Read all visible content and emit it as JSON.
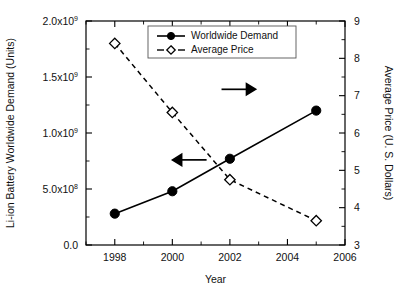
{
  "chart_data": {
    "type": "line",
    "title": "",
    "xlabel": "Year",
    "ylabel": "Li-ion Battery Worldwide Demand (Units)",
    "y2label": "Average Price (U. S. Dollars)",
    "x": [
      1998,
      2000,
      2002,
      2005
    ],
    "xlim": [
      1997,
      2006
    ],
    "xticks": [
      1998,
      2000,
      2002,
      2004,
      2006
    ],
    "xticklabels": [
      "1998",
      "2000",
      "2002",
      "2004",
      "2006"
    ],
    "xminorticks": [
      1997,
      1999,
      2001,
      2003,
      2005
    ],
    "ylim": [
      0,
      2000000000
    ],
    "yticks": [
      0,
      500000000,
      1000000000,
      1500000000,
      2000000000
    ],
    "yticklabels": [
      "0.0",
      "5.0x10",
      "1.0x10",
      "1.5x10",
      "2.0x10"
    ],
    "ytickexponents": [
      "",
      "8",
      "9",
      "9",
      "9"
    ],
    "yminorticks": [
      250000000,
      750000000,
      1250000000,
      1750000000
    ],
    "y2lim": [
      3,
      9
    ],
    "y2ticks": [
      3,
      4,
      5,
      6,
      7,
      8,
      9
    ],
    "y2ticklabels": [
      "3",
      "4",
      "5",
      "6",
      "7",
      "8",
      "9"
    ],
    "y2minorticks": [
      3.5,
      4.5,
      5.5,
      6.5,
      7.5,
      8.5
    ],
    "grid": false,
    "legend_position": "top-center",
    "series": [
      {
        "name": "Worldwide Demand",
        "axis": "left",
        "linestyle": "solid",
        "marker": "filled-circle",
        "color": "#000000",
        "values": [
          280000000,
          480000000,
          770000000,
          1200000000
        ]
      },
      {
        "name": "Average Price",
        "axis": "right",
        "linestyle": "dashed",
        "marker": "open-diamond",
        "color": "#000000",
        "values": [
          8.4,
          6.55,
          4.75,
          3.65
        ]
      }
    ],
    "annotations": [
      {
        "name": "left-axis-arrow",
        "direction": "left",
        "x": 2000.6,
        "y_frac": 0.62
      },
      {
        "name": "right-axis-arrow",
        "direction": "right",
        "x": 2002.3,
        "y_frac": 0.305
      }
    ]
  },
  "legend": {
    "items": [
      {
        "label": "Worldwide Demand",
        "marker": "filled-circle",
        "linestyle": "solid"
      },
      {
        "label": "Average Price",
        "marker": "open-diamond",
        "linestyle": "dashed"
      }
    ]
  }
}
